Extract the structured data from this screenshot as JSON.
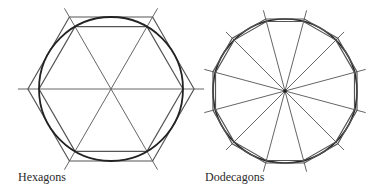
{
  "figures": [
    {
      "id": "hexagons",
      "label": "Hexagons",
      "center": [
        111,
        89
      ],
      "circle_radius": 72,
      "outer_polygon": {
        "sides": 6,
        "type": "circumscribed",
        "apothem": 72
      },
      "inner_polygon": {
        "sides": 6,
        "type": "inscribed",
        "radius": 72
      },
      "diameters": 3
    },
    {
      "id": "dodecagons",
      "label": "Dodecagons",
      "center": [
        285,
        91
      ],
      "circle_radius": 72,
      "outer_polygon": {
        "sides": 12,
        "type": "circumscribed"
      },
      "inner_polygon": {
        "sides": 12,
        "type": "inscribed"
      },
      "spokes": 12
    }
  ],
  "colors": {
    "circle": "#222222",
    "polygon": "#555555",
    "construction_line": "#666666",
    "label": "#2a2a2a",
    "background": "#ffffff"
  }
}
